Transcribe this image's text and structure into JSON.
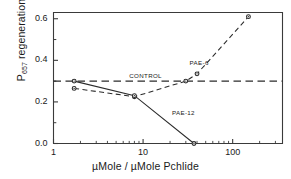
{
  "chart_data": {
    "type": "line",
    "title": "",
    "xlabel": "µMole / µMole Pchlide",
    "ylabel_text": "P",
    "ylabel_sub": "657",
    "ylabel_rest": " regeneration",
    "xscale": "log",
    "xlim": [
      1,
      360
    ],
    "ylim": [
      0.0,
      0.63
    ],
    "xticks": [
      {
        "value": 1,
        "label": "1"
      },
      {
        "value": 10,
        "label": "10"
      },
      {
        "value": 100,
        "label": "100"
      }
    ],
    "yticks": [
      {
        "value": 0.0,
        "label": "0.0"
      },
      {
        "value": 0.2,
        "label": "0.2"
      },
      {
        "value": 0.4,
        "label": "0.4"
      },
      {
        "value": 0.6,
        "label": "0.6"
      }
    ],
    "yminorticks": [
      0.1,
      0.3,
      0.5
    ],
    "grid": false,
    "legend": "inline-annotations",
    "annotations": [
      {
        "text": "CONTROL",
        "x": 7.0,
        "y": 0.325
      },
      {
        "text": "PAE-6",
        "x": 33.0,
        "y": 0.385
      },
      {
        "text": "PAE-12",
        "x": 21.0,
        "y": 0.145
      }
    ],
    "series": [
      {
        "name": "CONTROL",
        "style": "dashed",
        "markers": false,
        "points": [
          [
            1.0,
            0.3
          ],
          [
            360.0,
            0.3
          ]
        ]
      },
      {
        "name": "PAE-6",
        "style": "dashed",
        "markers": true,
        "points": [
          [
            1.7,
            0.265
          ],
          [
            8.0,
            0.225
          ],
          [
            30.0,
            0.3
          ],
          [
            40.0,
            0.335
          ],
          [
            150.0,
            0.61
          ]
        ]
      },
      {
        "name": "PAE-12",
        "style": "solid",
        "markers": true,
        "points": [
          [
            1.7,
            0.3
          ],
          [
            8.0,
            0.23
          ],
          [
            37.0,
            0.0
          ]
        ]
      }
    ],
    "colors": {
      "axis": "#3a3a3a",
      "control_line": "#2b2b2b",
      "pae6": "#2b2b2b",
      "pae12": "#2b2b2b",
      "background": "#ffffff"
    }
  }
}
